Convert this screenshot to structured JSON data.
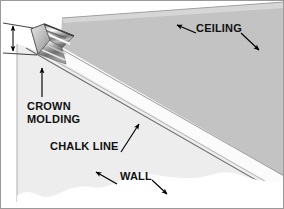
{
  "figure": {
    "kind": "technical-illustration",
    "border_color": "#9a9a9a",
    "background_color": "#ffffff"
  },
  "surfaces": {
    "ceiling": {
      "name": "ceiling-plane",
      "color": "#c3c3c3"
    },
    "wall": {
      "name": "wall-plane",
      "color": "#ededed"
    },
    "molding_band": {
      "name": "crown-molding-band",
      "color": "#fbfbfb"
    },
    "ceiling_top_strip": {
      "name": "ceiling-top-strip",
      "color": "#d2d2d2"
    },
    "torn_edge": {
      "name": "torn-paper-edge",
      "color": "#ffffff"
    }
  },
  "lines": {
    "chalk_line_color": "#6e6e6e",
    "edge_color": "#808080",
    "corner_color": "#9b9b9b"
  },
  "molding_piece": {
    "name": "crown-molding-profile",
    "highlight": "#fdfdfd",
    "midtone": "#9d9d9d",
    "shadow": "#4a4a4a",
    "end_face": "#cfcfcf"
  },
  "labels": {
    "ceiling": "CEILING",
    "crown_molding_line1": "CROWN",
    "crown_molding_line2": "MOLDING",
    "chalk_line": "CHALK LINE",
    "wall": "WALL"
  },
  "annotations": {
    "ceiling_arrow_left": "arrow pointing up-left to ceiling plane",
    "ceiling_arrow_right": "arrow pointing down-right to ceiling plane",
    "crown_molding_arrow": "vertical arrow pointing up to molding piece",
    "chalk_line_arrow": "arrow pointing up-right to chalk line",
    "wall_arrow_left": "arrow pointing up-left to wall plane",
    "wall_arrow_right": "arrow pointing down-right to wall plane",
    "dimension_arrow": "double-headed vertical dimension arrow at molding end"
  },
  "text_color": "#111111"
}
